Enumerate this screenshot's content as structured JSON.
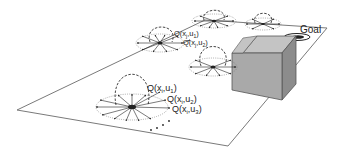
{
  "diagram": {
    "title": "",
    "goal_label": "Goal",
    "q_labels": {
      "main": [
        {
          "text": "Q(x",
          "sub1": "i",
          "mid": ",u",
          "sub2": "1",
          "close": ")"
        },
        {
          "text": "Q(x",
          "sub1": "i",
          "mid": ",u",
          "sub2": "2",
          "close": ")"
        },
        {
          "text": "Q(x",
          "sub1": "i",
          "mid": ",u",
          "sub2": "3",
          "close": ")"
        }
      ],
      "upper": [
        {
          "text": "Q(x",
          "sub1": "j",
          "mid": ",u",
          "sub2": "1",
          "close": ")"
        },
        {
          "text": "Q(x",
          "sub1": "j",
          "mid": ",u",
          "sub2": "2",
          "close": ")"
        }
      ]
    },
    "nodes": [
      {
        "id": "node-main",
        "cx": 132,
        "cy": 107,
        "rx": 36,
        "ry": 13
      },
      {
        "id": "node-upper-left",
        "cx": 160,
        "cy": 43,
        "rx": 24,
        "ry": 9
      },
      {
        "id": "node-center",
        "cx": 213,
        "cy": 67,
        "rx": 24,
        "ry": 9
      },
      {
        "id": "node-top",
        "cx": 214,
        "cy": 21,
        "rx": 22,
        "ry": 7
      },
      {
        "id": "node-right",
        "cx": 263,
        "cy": 24,
        "rx": 18,
        "ry": 6
      }
    ],
    "colors": {
      "plane_edge": "#7a7a7a",
      "box_front": "#a9a9a9",
      "box_side": "#8c8c8c",
      "box_top": "#c4c4c4",
      "ink": "#222222"
    }
  }
}
